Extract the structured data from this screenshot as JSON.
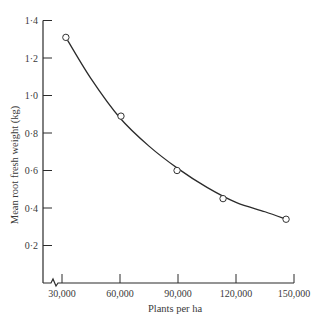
{
  "chart_data": {
    "type": "scatter",
    "title": "",
    "xlabel": "Plants per ha",
    "ylabel": "Mean root fresh weight (kg)",
    "x_ticks": [
      30000,
      60000,
      90000,
      120000,
      150000
    ],
    "x_tick_labels": [
      "30,000",
      "60,000",
      "90,000",
      "120,000",
      "150,000"
    ],
    "y_ticks": [
      0.2,
      0.4,
      0.6,
      0.8,
      1.0,
      1.2,
      1.4
    ],
    "y_tick_labels": [
      "0·2",
      "0·4",
      "0·6",
      "0·8",
      "1·0",
      "1·2",
      "1·4"
    ],
    "xlim": [
      30000,
      150000
    ],
    "ylim": [
      0,
      1.4
    ],
    "axis_break_x": true,
    "grid": false,
    "legend": null,
    "series": [
      {
        "name": "observed",
        "marker": "open-circle",
        "x": [
          32000,
          60500,
          89500,
          113300,
          145900
        ],
        "y": [
          1.31,
          0.89,
          0.6,
          0.45,
          0.34
        ]
      },
      {
        "name": "fitted curve",
        "marker": "line",
        "x": [
          32000,
          45000,
          60000,
          75000,
          90000,
          105000,
          120000,
          135000,
          146000
        ],
        "y": [
          1.31,
          1.09,
          0.88,
          0.73,
          0.61,
          0.51,
          0.43,
          0.38,
          0.34
        ]
      }
    ]
  },
  "axes": {
    "x_label": "Plants per ha",
    "y_label": "Mean root fresh weight (kg)"
  }
}
